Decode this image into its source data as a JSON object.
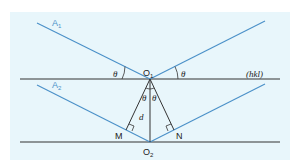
{
  "diagram": {
    "colors": {
      "background": "#e8f6fb",
      "plane_line": "#333333",
      "ray": "#4a90c8",
      "construction": "#333333"
    },
    "labels": {
      "ray1": "A",
      "ray1_sub": "1",
      "ray2": "A",
      "ray2_sub": "2",
      "o1": "O",
      "o1_sub": "1",
      "o2": "O",
      "o2_sub": "2",
      "m": "M",
      "n": "N",
      "d": "d",
      "theta": "θ",
      "plane": "(hkl)"
    },
    "elements": {
      "planes": [
        "upper lattice plane (hkl)",
        "lower lattice plane"
      ],
      "rays": [
        "incident A1",
        "reflected A1",
        "incident A2",
        "reflected A2"
      ],
      "points": [
        "O1",
        "O2",
        "M",
        "N"
      ],
      "angles": [
        "θ left",
        "θ right",
        "θ at O1 left",
        "θ at O1 right"
      ],
      "right_angles": [
        "at M",
        "at N"
      ],
      "spacing": "d"
    }
  }
}
